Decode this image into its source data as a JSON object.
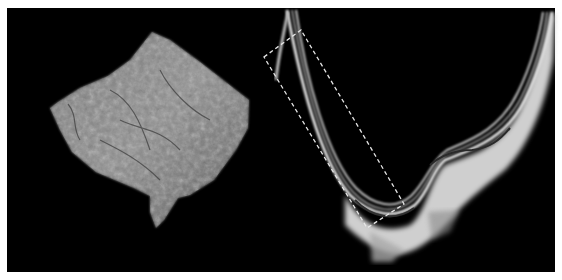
{
  "figure": {
    "background": "#000000",
    "border": "#ffffff",
    "panels": [
      {
        "id": "left",
        "content": "3D en-face volume rendering of retinal tissue",
        "tone": "#8a8a8a"
      },
      {
        "id": "right",
        "content": "OCT B-scan cross-section with curved retinal layers",
        "tone": "#d8d8d8"
      }
    ],
    "annotation": {
      "shape": "dashed-rectangle",
      "color": "#e6e6e6"
    }
  }
}
